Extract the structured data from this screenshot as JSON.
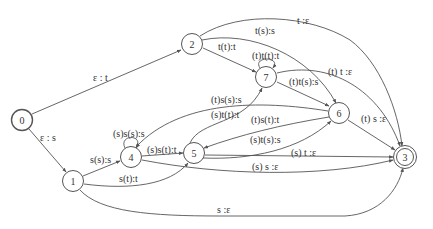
{
  "diagram": {
    "type": "finite-state-transducer",
    "nodes": [
      {
        "id": "0",
        "label": "0",
        "x": 22,
        "y": 120,
        "start": true
      },
      {
        "id": "1",
        "label": "1",
        "x": 73,
        "y": 181
      },
      {
        "id": "2",
        "label": "2",
        "x": 192,
        "y": 44
      },
      {
        "id": "3",
        "label": "3",
        "x": 405,
        "y": 157,
        "final": true
      },
      {
        "id": "4",
        "label": "4",
        "x": 131,
        "y": 157
      },
      {
        "id": "5",
        "label": "5",
        "x": 194,
        "y": 153
      },
      {
        "id": "6",
        "label": "6",
        "x": 339,
        "y": 113
      },
      {
        "id": "7",
        "label": "7",
        "x": 266,
        "y": 77
      }
    ],
    "edges": [
      {
        "from": "0",
        "to": "2",
        "label": "ε : t"
      },
      {
        "from": "0",
        "to": "1",
        "label": "ε : s"
      },
      {
        "from": "2",
        "to": "3",
        "label": "t :ε"
      },
      {
        "from": "2",
        "to": "6",
        "label": "t(s):s"
      },
      {
        "from": "2",
        "to": "7",
        "label": "t(t):t"
      },
      {
        "from": "7",
        "to": "7",
        "label": "(t)t(t):t"
      },
      {
        "from": "7",
        "to": "6",
        "label": "(t)t(s):s"
      },
      {
        "from": "7",
        "to": "3",
        "label": "(t) t :ε"
      },
      {
        "from": "6",
        "to": "4",
        "label": "(t)s(s):s"
      },
      {
        "from": "5",
        "to": "7",
        "label": "(s)t(t):t"
      },
      {
        "from": "6",
        "to": "5",
        "label": "(t)s(t):t"
      },
      {
        "from": "5",
        "to": "6",
        "label": "(s)t(s):s"
      },
      {
        "from": "6",
        "to": "3",
        "label": "(t) s :ε"
      },
      {
        "from": "5",
        "to": "3",
        "label": "(s) t :ε"
      },
      {
        "from": "4",
        "to": "3",
        "label": "(s) s :ε"
      },
      {
        "from": "4",
        "to": "4",
        "label": "(s)s(s):s"
      },
      {
        "from": "4",
        "to": "5",
        "label": "(s)s(t):t"
      },
      {
        "from": "1",
        "to": "4",
        "label": "s(s):s"
      },
      {
        "from": "1",
        "to": "5",
        "label": "s(t):t"
      },
      {
        "from": "1",
        "to": "3",
        "label": "s :ε"
      }
    ]
  }
}
